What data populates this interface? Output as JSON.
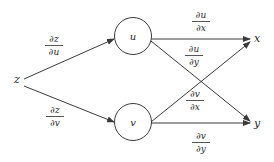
{
  "diagram": {
    "type": "tree-diagram",
    "nodes": {
      "z": {
        "label": "z"
      },
      "u": {
        "label": "u"
      },
      "v": {
        "label": "v"
      },
      "x": {
        "label": "x"
      },
      "y": {
        "label": "y"
      }
    },
    "edges": [
      {
        "from": "z",
        "to": "u",
        "num": "∂z",
        "den": "∂u"
      },
      {
        "from": "z",
        "to": "v",
        "num": "∂z",
        "den": "∂v"
      },
      {
        "from": "u",
        "to": "x",
        "num": "∂u",
        "den": "∂x"
      },
      {
        "from": "u",
        "to": "y",
        "num": "∂u",
        "den": "∂y"
      },
      {
        "from": "v",
        "to": "x",
        "num": "∂v",
        "den": "∂x"
      },
      {
        "from": "v",
        "to": "y",
        "num": "∂v",
        "den": "∂y"
      }
    ],
    "colors": {
      "line": "#3a3a3a",
      "text": "#2a2a2a",
      "background": "#ffffff"
    }
  }
}
